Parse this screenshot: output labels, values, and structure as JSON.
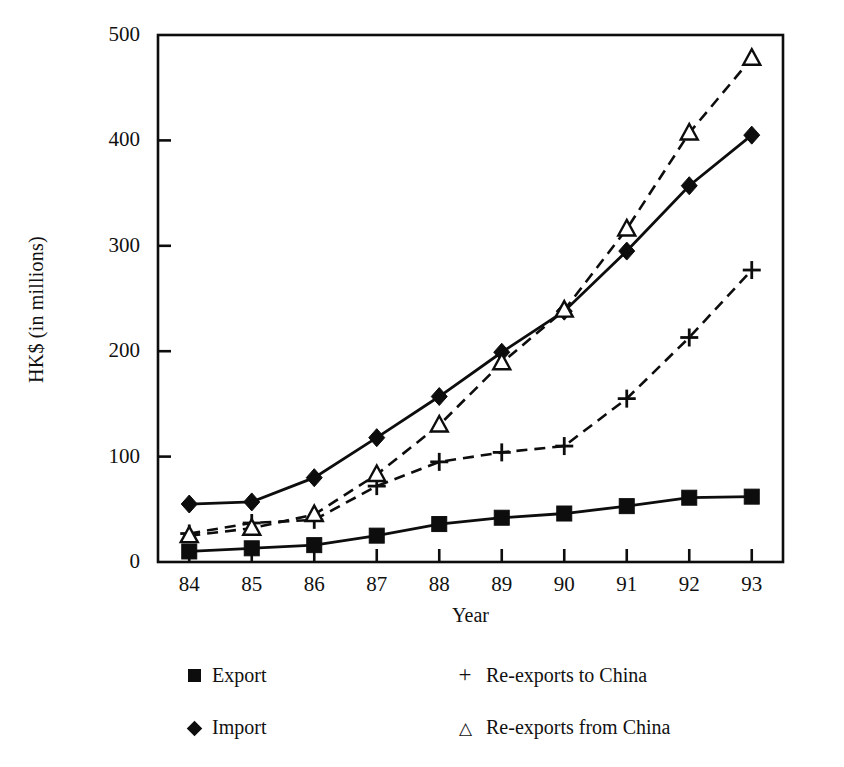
{
  "chart_data": {
    "type": "line",
    "title": "",
    "xlabel": "Year",
    "ylabel": "HK$ (in millions)",
    "x": [
      "84",
      "85",
      "86",
      "87",
      "88",
      "89",
      "90",
      "91",
      "92",
      "93"
    ],
    "xlim": [
      83.5,
      93.5
    ],
    "ylim": [
      0,
      500
    ],
    "yticks": [
      "0",
      "100",
      "200",
      "300",
      "400",
      "500"
    ],
    "grid": false,
    "legend_position": "below-axes",
    "series": [
      {
        "name": "Export",
        "marker": "filled-square",
        "linestyle": "solid",
        "values": [
          10,
          13,
          16,
          25,
          36,
          42,
          46,
          53,
          61,
          62
        ]
      },
      {
        "name": "Import",
        "marker": "filled-diamond",
        "linestyle": "solid",
        "values": [
          55,
          57,
          80,
          118,
          157,
          199,
          238,
          295,
          357,
          405
        ]
      },
      {
        "name": "Re-exports to China",
        "marker": "plus",
        "linestyle": "dashed",
        "values": [
          27,
          37,
          40,
          72,
          95,
          104,
          110,
          155,
          213,
          277
        ]
      },
      {
        "name": "Re-exports from China",
        "marker": "open-triangle",
        "linestyle": "dashed",
        "values": [
          25,
          32,
          45,
          83,
          130,
          189,
          239,
          316,
          407,
          478
        ]
      }
    ]
  },
  "legend": {
    "items": [
      {
        "label": "Export",
        "marker": "filled-square"
      },
      {
        "label": "Import",
        "marker": "filled-diamond"
      },
      {
        "label": "Re-exports to China",
        "marker": "plus"
      },
      {
        "label": "Re-exports from China",
        "marker": "open-triangle"
      }
    ]
  },
  "colors": {
    "ink": "#0d0d0d",
    "background": "#ffffff"
  }
}
